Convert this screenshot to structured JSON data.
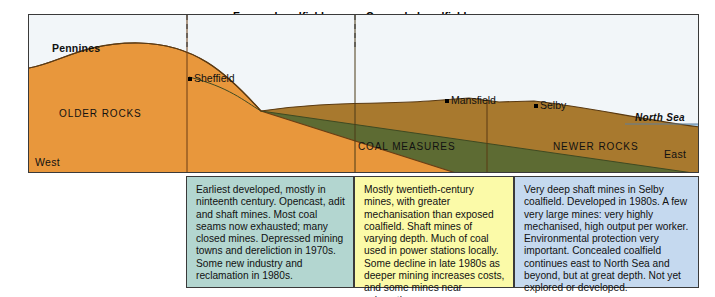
{
  "diagram": {
    "title_annotations": {
      "exposed_label": "Exposed coalfield",
      "concealed_label": "Concealed coalfield"
    },
    "cross_section": {
      "relief_label": "Pennines",
      "strata": [
        {
          "name": "older-rocks",
          "label": "OLDER ROCKS",
          "color": "#e8973c"
        },
        {
          "name": "coal-measures",
          "label": "COAL MEASURES",
          "color": "#5d6b33"
        },
        {
          "name": "newer-rocks",
          "label": "NEWER ROCKS",
          "color": "#a8792e"
        }
      ],
      "sea": {
        "label": "North Sea",
        "color": "#a9cde8"
      },
      "sky_color": "#f2f6f9",
      "compass": {
        "west": "West",
        "east": "East"
      },
      "cities": [
        {
          "name": "sheffield",
          "label": "Sheffield"
        },
        {
          "name": "mansfield",
          "label": "Mansfield"
        },
        {
          "name": "selby",
          "label": "Selby"
        }
      ]
    },
    "description_boxes": [
      {
        "name": "exposed-coalfield",
        "text": "Earliest developed, mostly in ninteenth century. Opencast, adit and shaft mines. Most coal seams now exhausted; many closed mines. Depressed mining towns and dereliction in 1970s. Some new industry and reclamation in 1980s.",
        "color": "#b3d6d0"
      },
      {
        "name": "concealed-coalfield",
        "text": "Mostly twentieth-century mines, with greater mechanisation than exposed coalfield. Shaft mines of varying depth. Much of coal used in power stations locally. Some decline in late 1980s as deeper mining increases costs, and some mines near exhaustion.",
        "color": "#fbfaa8"
      },
      {
        "name": "selby-coalfield",
        "text": "Very deep shaft mines in Selby coalfield. Developed in 1980s. A few very large mines: very highly mechanised, high output per worker. Environmental protection very important. Concealed coalfield continues east to North Sea and beyond, but at great depth. Not yet explored or developed.",
        "color": "#c5d9ef"
      }
    ]
  }
}
